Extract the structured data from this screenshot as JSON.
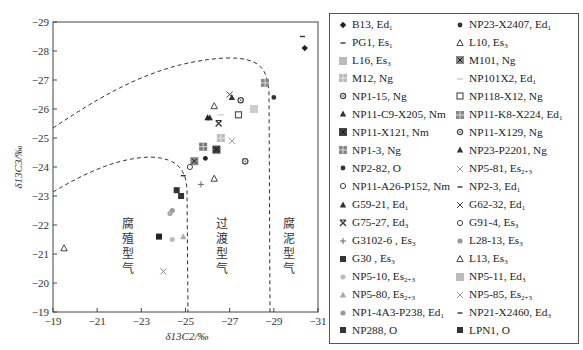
{
  "chart_data": {
    "type": "scatter",
    "title": "",
    "xlabel": "δ13C2/‰",
    "ylabel": "δ13C3/‰",
    "xlim": [
      -19,
      -31
    ],
    "ylim": [
      -19,
      -29
    ],
    "x_ticks": [
      "-19",
      "-21",
      "-23",
      "-25",
      "-27",
      "-29",
      "-31"
    ],
    "y_ticks": [
      "-29",
      "-28",
      "-27",
      "-26",
      "-25",
      "-24",
      "-23",
      "-22",
      "-21",
      "-20",
      "-19"
    ],
    "grid": false,
    "legend_position": "right",
    "regions": [
      {
        "label": "腐殖型气",
        "chars": [
          "腐",
          "殖",
          "型",
          "气"
        ]
      },
      {
        "label": "过渡型气",
        "chars": [
          "过",
          "渡",
          "型",
          "气"
        ]
      },
      {
        "label": "腐泥型气",
        "chars": [
          "腐",
          "泥",
          "型",
          "气"
        ]
      }
    ],
    "series": [
      {
        "name": "B13, Ed1",
        "marker": "diamond",
        "color": "#222",
        "x": [
          -30.4
        ],
        "y": [
          -28.1
        ]
      },
      {
        "name": "NP23-X2407, Ed1",
        "marker": "dot",
        "color": "#333",
        "x": [
          -29.0
        ],
        "y": [
          -26.4
        ]
      },
      {
        "name": "PG1, Es1",
        "marker": "dash",
        "color": "#333",
        "x": [
          -30.3
        ],
        "y": [
          -28.5
        ]
      },
      {
        "name": "L10, Es3",
        "marker": "tri-open",
        "color": "#444",
        "x": [
          -26.3
        ],
        "y": [
          -26.1
        ]
      },
      {
        "name": "L16, Es3",
        "marker": "square-light",
        "color": "#bbb",
        "x": [
          -28.1
        ],
        "y": [
          -26.0
        ]
      },
      {
        "name": "M101, Ng",
        "marker": "square-x",
        "color": "#888",
        "x": [
          -25.4
        ],
        "y": [
          -24.2
        ]
      },
      {
        "name": "M12, Ng",
        "marker": "square-grid-light",
        "color": "#bbb",
        "x": [
          -26.6
        ],
        "y": [
          -25.0
        ]
      },
      {
        "name": "NP101X2, Ed1",
        "marker": "dash-light",
        "color": "#ccc",
        "x": [
          -26.6
        ],
        "y": [
          -25.8
        ]
      },
      {
        "name": "NP1-15, Ng",
        "marker": "circle-dot",
        "color": "#444",
        "x": [
          -27.5
        ],
        "y": [
          -26.3
        ]
      },
      {
        "name": "NP118-X12, Ng",
        "marker": "square-open",
        "color": "#555",
        "x": [
          -27.4
        ],
        "y": [
          -25.8
        ]
      },
      {
        "name": "NP11-C9-X205, Nm",
        "marker": "tri",
        "color": "#333",
        "x": [
          -26.1
        ],
        "y": [
          -25.7
        ]
      },
      {
        "name": "NP11-K8-X224, Ed1",
        "marker": "square-grid",
        "color": "#888",
        "x": [
          -28.6
        ],
        "y": [
          -26.9
        ]
      },
      {
        "name": "NP11-X121, Nm",
        "marker": "square-x-dark",
        "color": "#444",
        "x": [
          -26.4
        ],
        "y": [
          -24.6
        ]
      },
      {
        "name": "NP11-X129, Ng",
        "marker": "circle-dot",
        "color": "#555",
        "x": [
          -27.7
        ],
        "y": [
          -24.2
        ]
      },
      {
        "name": "NP1-3, Ng",
        "marker": "square-grid",
        "color": "#777",
        "x": [
          -25.8
        ],
        "y": [
          -24.7
        ]
      },
      {
        "name": "NP23-P2201, Ng",
        "marker": "tri",
        "color": "#333",
        "x": [
          -27.1
        ],
        "y": [
          -26.4
        ]
      },
      {
        "name": "NP2-82, O",
        "marker": "dot",
        "color": "#222",
        "x": [
          -25.9
        ],
        "y": [
          -24.3
        ]
      },
      {
        "name": "NP5-81, Es2+3",
        "marker": "x-light",
        "color": "#999",
        "x": [
          -27.1
        ],
        "y": [
          -24.9
        ]
      },
      {
        "name": "NP11-A26-P152, Nm",
        "marker": "circle-open",
        "color": "#444",
        "x": [
          -25.2
        ],
        "y": [
          -24.0
        ]
      },
      {
        "name": "NP2-3, Ed1",
        "marker": "dash",
        "color": "#333",
        "x": [
          -24.9
        ],
        "y": [
          -23.7
        ]
      },
      {
        "name": "G59-21, Ed1",
        "marker": "tri",
        "color": "#222",
        "x": [
          -26.0
        ],
        "y": [
          -25.7
        ]
      },
      {
        "name": "G62-32, Ed1",
        "marker": "x",
        "color": "#444",
        "x": [
          -27.0
        ],
        "y": [
          -26.5
        ]
      },
      {
        "name": "G75-27, Ed3",
        "marker": "x-bar",
        "color": "#333",
        "x": [
          -26.5
        ],
        "y": [
          -25.5
        ]
      },
      {
        "name": "G91-4, Es3",
        "marker": "circle-dot",
        "color": "#555",
        "x": [
          -27.7
        ],
        "y": [
          -24.2
        ]
      },
      {
        "name": "G3102-6, Es3",
        "marker": "plus",
        "color": "#666",
        "x": [
          -25.7
        ],
        "y": [
          -23.4
        ]
      },
      {
        "name": "L28-13, Es3",
        "marker": "dot-light",
        "color": "#999",
        "x": [
          -24.4
        ],
        "y": [
          -22.5
        ]
      },
      {
        "name": "G30, Es3",
        "marker": "square",
        "color": "#333",
        "x": [
          -24.6
        ],
        "y": [
          -23.2
        ]
      },
      {
        "name": "L13, Es3",
        "marker": "tri-open",
        "color": "#444",
        "x": [
          -19.5,
          -26.3
        ],
        "y": [
          -21.2,
          -23.6
        ]
      },
      {
        "name": "NP5-10, Es2+3",
        "marker": "star-light",
        "color": "#bbb",
        "x": [
          -24.4
        ],
        "y": [
          -21.5
        ]
      },
      {
        "name": "NP5-11, Ed3",
        "marker": "square-light",
        "color": "#ccc",
        "x": [
          -28.1
        ],
        "y": [
          -26.0
        ]
      },
      {
        "name": "NP5-80, Es2+3",
        "marker": "tri-light",
        "color": "#aaa",
        "x": [
          -24.9
        ],
        "y": [
          -21.6
        ]
      },
      {
        "name": "NP5-85, Es2+3",
        "marker": "x-light",
        "color": "#888",
        "x": [
          -24.0
        ],
        "y": [
          -20.4
        ]
      },
      {
        "name": "NP1-4A3-P238, Ed1",
        "marker": "dot-light",
        "color": "#aaa",
        "x": [
          -24.3
        ],
        "y": [
          -22.4
        ]
      },
      {
        "name": "NP21-X2460, Ed3",
        "marker": "dash",
        "color": "#222",
        "x": [],
        "y": []
      },
      {
        "name": "NP288, O",
        "marker": "square",
        "color": "#333",
        "x": [
          -24.8
        ],
        "y": [
          -23.0
        ]
      },
      {
        "name": "LPN1, O",
        "marker": "square",
        "color": "#222",
        "x": [
          -23.8
        ],
        "y": [
          -21.6
        ]
      }
    ]
  },
  "legend": {
    "items": [
      {
        "name": "B13, Ed",
        "sub": "1",
        "marker": "diamond"
      },
      {
        "name": "NP23-X2407, Ed",
        "sub": "1",
        "marker": "dot"
      },
      {
        "name": "PG1, Es",
        "sub": "1",
        "marker": "dash"
      },
      {
        "name": "L10, Es",
        "sub": "3",
        "marker": "tri-open"
      },
      {
        "name": "L16, Es",
        "sub": "3",
        "marker": "square-light"
      },
      {
        "name": "M101, Ng",
        "sub": "",
        "marker": "square-x"
      },
      {
        "name": "M12, Ng",
        "sub": "",
        "marker": "square-grid-light"
      },
      {
        "name": "NP101X2, Ed",
        "sub": "1",
        "marker": "dash-light"
      },
      {
        "name": "NP1-15, Ng",
        "sub": "",
        "marker": "circle-dot"
      },
      {
        "name": "NP118-X12, Ng",
        "sub": "",
        "marker": "square-open"
      },
      {
        "name": "NP11-C9-X205, Nm",
        "sub": "",
        "marker": "tri"
      },
      {
        "name": "NP11-K8-X224, Ed",
        "sub": "1",
        "marker": "square-grid"
      },
      {
        "name": "NP11-X121, Nm",
        "sub": "",
        "marker": "square-x-dark"
      },
      {
        "name": "NP11-X129, Ng",
        "sub": "",
        "marker": "circle-dot"
      },
      {
        "name": "NP1-3, Ng",
        "sub": "",
        "marker": "square-grid"
      },
      {
        "name": "NP23-P2201, Ng",
        "sub": "",
        "marker": "tri"
      },
      {
        "name": "NP2-82, O",
        "sub": "",
        "marker": "dot"
      },
      {
        "name": "NP5-81, Es",
        "sub": "2+3",
        "marker": "x-light"
      },
      {
        "name": "NP11-A26-P152, Nm",
        "sub": "",
        "marker": "circle-open"
      },
      {
        "name": "NP2-3, Ed",
        "sub": "1",
        "marker": "dash"
      },
      {
        "name": "G59-21, Ed",
        "sub": "1",
        "marker": "tri"
      },
      {
        "name": "G62-32, Ed",
        "sub": "1",
        "marker": "x"
      },
      {
        "name": "G75-27, Ed",
        "sub": "3",
        "marker": "x-bar"
      },
      {
        "name": "G91-4, Es",
        "sub": "3",
        "marker": "circle-open"
      },
      {
        "name": "G3102-6 , Es",
        "sub": "3",
        "marker": "plus"
      },
      {
        "name": "L28-13, Es",
        "sub": "3",
        "marker": "dot-light"
      },
      {
        "name": "G30 , Es",
        "sub": "3",
        "marker": "square"
      },
      {
        "name": "L13, Es",
        "sub": "3",
        "marker": "tri-open"
      },
      {
        "name": "NP5-10, Es",
        "sub": "2+3",
        "marker": "star-light"
      },
      {
        "name": "NP5-11, Ed",
        "sub": "3",
        "marker": "square-light"
      },
      {
        "name": "NP5-80, Es",
        "sub": "2+3",
        "marker": "tri-light"
      },
      {
        "name": "NP5-85, Es",
        "sub": "2+3",
        "marker": "x-light"
      },
      {
        "name": "NP1-4A3-P238, Ed",
        "sub": "1",
        "marker": "dot-light"
      },
      {
        "name": "NP21-X2460, Ed",
        "sub": "3",
        "marker": "dash"
      },
      {
        "name": "NP288, O",
        "sub": "",
        "marker": "square"
      },
      {
        "name": "LPN1, O",
        "sub": "",
        "marker": "square"
      }
    ]
  }
}
